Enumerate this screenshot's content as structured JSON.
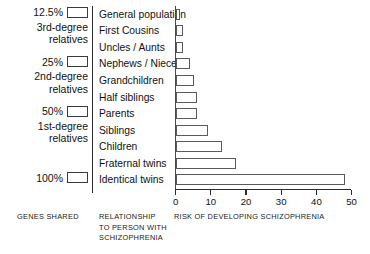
{
  "chart_data": {
    "type": "bar",
    "orientation": "horizontal",
    "title": "",
    "xlabel": "RISK OF DEVELOPING SCHIZOPHRENIA",
    "ylabel": "RELATIONSHIP TO PERSON WITH SCHIZOPHRENIA",
    "xlim": [
      0,
      50
    ],
    "xticks": [
      0,
      10,
      20,
      30,
      40,
      50
    ],
    "grid": false,
    "legend": null,
    "categories": [
      "General population",
      "First Cousins",
      "Uncles / Aunts",
      "Nephews / Nieces",
      "Grandchildren",
      "Half siblings",
      "Parents",
      "Siblings",
      "Children",
      "Fraternal twins",
      "Identical twins"
    ],
    "values": [
      1,
      2,
      2,
      4,
      5,
      6,
      6,
      9,
      13,
      17,
      48
    ],
    "bar_facecolor": "#ffffff",
    "bar_edgecolor": "#5a5a5a"
  },
  "genes_shared": {
    "groups": [
      {
        "percent": "12.5%",
        "line1": "3rd-degree",
        "line2": "relatives"
      },
      {
        "percent": "25%",
        "line1": "2nd-degree",
        "line2": "relatives"
      },
      {
        "percent": "50%",
        "line1": "1st-degree",
        "line2": "relatives"
      },
      {
        "percent": "100%",
        "line1": "",
        "line2": ""
      }
    ]
  },
  "captions": {
    "genes": "GENES SHARED",
    "relationship": "RELATIONSHIP\nTO PERSON WITH\nSCHIZOPHRENIA",
    "risk": "RISK OF DEVELOPING SCHIZOPHRENIA"
  }
}
